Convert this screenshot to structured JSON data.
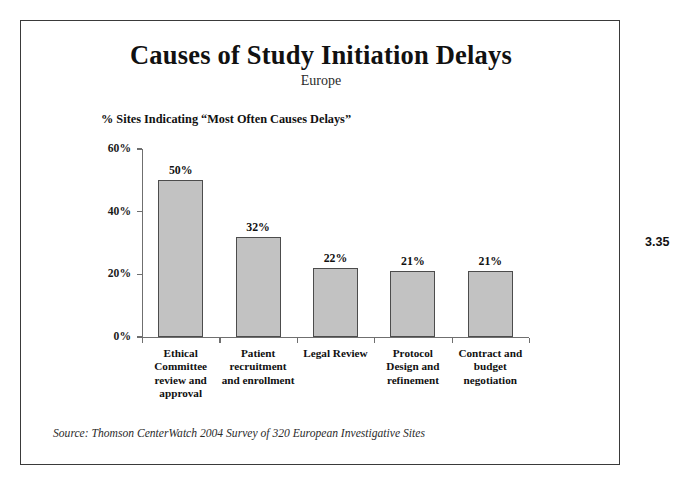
{
  "slide": {
    "title": "Causes of Study Initiation Delays",
    "subtitle": "Europe",
    "axis_caption": "% Sites Indicating “Most Often Causes Delays”",
    "source": "Source:  Thomson CenterWatch 2004 Survey of 320 European Investigative Sites",
    "page_number": "3.35",
    "bar_fill_color": "#c2c2c2",
    "bar_border_color": "#4c4c4c",
    "frame_border_color": "#3a3a3a",
    "background_color": "#ffffff"
  },
  "chart_data": {
    "type": "bar",
    "title": "Causes of Study Initiation Delays",
    "subtitle": "Europe",
    "xlabel": "",
    "ylabel": "% Sites Indicating “Most Often Causes Delays”",
    "ylim": [
      0,
      60
    ],
    "grid": false,
    "legend": "none",
    "ytick_labels": [
      "0%",
      "20%",
      "40%",
      "60%"
    ],
    "ytick_values": [
      0,
      20,
      40,
      60
    ],
    "categories": [
      "Ethical Committee review and approval",
      "Patient recruitment and enrollment",
      "Legal Review",
      "Protocol Design and refinement",
      "Contract and budget negotiation"
    ],
    "category_lines": [
      [
        "Ethical",
        "Committee",
        "review and",
        "approval"
      ],
      [
        "Patient",
        "recruitment",
        "and enrollment"
      ],
      [
        "Legal Review"
      ],
      [
        "Protocol",
        "Design and",
        "refinement"
      ],
      [
        "Contract and",
        "budget",
        "negotiation"
      ]
    ],
    "values": [
      50,
      32,
      22,
      21,
      21
    ],
    "value_labels": [
      "50%",
      "32%",
      "22%",
      "21%",
      "21%"
    ]
  }
}
